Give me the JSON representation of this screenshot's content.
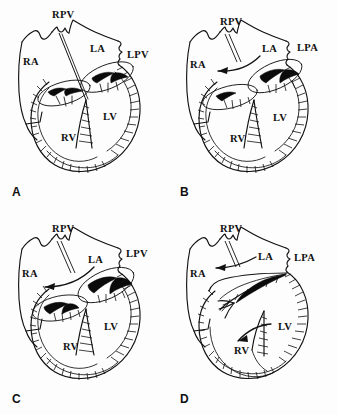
{
  "figure": {
    "background_color": "#fdfdfd",
    "ink_color": "#111111",
    "columns": 2,
    "rows": 2
  },
  "panels": [
    {
      "id": "A",
      "letter": "A",
      "labels": {
        "rpv": "RPV",
        "ra": "RA",
        "la": "LA",
        "lpv": "LPV",
        "rv": "RV",
        "lv": "LV"
      },
      "arrows": []
    },
    {
      "id": "B",
      "letter": "B",
      "labels": {
        "rpv": "RPV",
        "ra": "RA",
        "la": "LA",
        "lpa": "LPA",
        "rv": "RV",
        "lv": "LV"
      },
      "arrows": [
        "atrial-flow-to-right-atrium"
      ]
    },
    {
      "id": "C",
      "letter": "C",
      "labels": {
        "rpv": "RPV",
        "ra": "RA",
        "la": "LA",
        "lpv": "LPV",
        "rv": "RV",
        "lv": "LV"
      },
      "arrows": [
        "atrial-flow-to-right-atrium"
      ]
    },
    {
      "id": "D",
      "letter": "D",
      "labels": {
        "rpv": "RPV",
        "ra": "RA",
        "la": "LA",
        "lpa": "LPA",
        "rv": "RV",
        "lv": "LV"
      },
      "arrows": [
        "atrial-flow-to-right-atrium",
        "ventricular-flow-to-right-ventricle"
      ]
    }
  ]
}
